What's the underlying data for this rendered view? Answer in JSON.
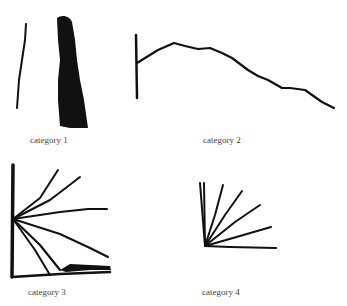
{
  "figure": {
    "panels": [
      {
        "id": "category-1",
        "caption": "category 1"
      },
      {
        "id": "category-2",
        "caption": "category 2"
      },
      {
        "id": "category-3",
        "caption": "category 3"
      },
      {
        "id": "category-4",
        "caption": "category 4"
      }
    ],
    "ink_color": "#111111",
    "background": "#ffffff"
  }
}
